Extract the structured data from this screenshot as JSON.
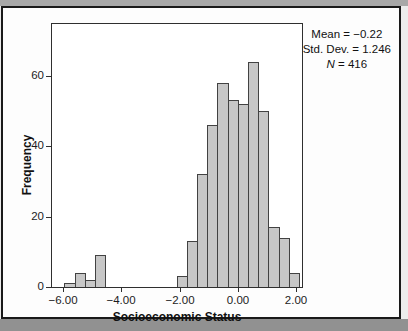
{
  "figure": {
    "stats_box": {
      "line1": "Mean = −0.22",
      "line2": "Std. Dev. = 1.246",
      "line3_italic": "N",
      "line3_rest": " = 416"
    }
  },
  "chart_data": {
    "type": "bar",
    "subtype": "histogram",
    "title": "",
    "xlabel": "Socioeconomic Status",
    "ylabel": "Frequency",
    "legend": "none",
    "grid": false,
    "xlim": [
      -6.41,
      2.25
    ],
    "ylim": [
      0,
      75
    ],
    "x_ticks": [
      {
        "value": -6,
        "label": "−6.00"
      },
      {
        "value": -4,
        "label": "−4.00"
      },
      {
        "value": -2,
        "label": "−2.00"
      },
      {
        "value": 0,
        "label": "0.00"
      },
      {
        "value": 2,
        "label": "2.00"
      }
    ],
    "y_ticks": [
      {
        "value": 0,
        "label": "0"
      },
      {
        "value": 20,
        "label": "20"
      },
      {
        "value": 40,
        "label": "40"
      },
      {
        "value": 60,
        "label": "60"
      }
    ],
    "bin_width": 0.35,
    "bars": [
      {
        "x_start": -5.95,
        "count": 1
      },
      {
        "x_start": -5.6,
        "count": 4
      },
      {
        "x_start": -5.25,
        "count": 2
      },
      {
        "x_start": -4.9,
        "count": 9
      },
      {
        "x_start": -2.1,
        "count": 3
      },
      {
        "x_start": -1.75,
        "count": 13
      },
      {
        "x_start": -1.4,
        "count": 32
      },
      {
        "x_start": -1.05,
        "count": 46
      },
      {
        "x_start": -0.7,
        "count": 58
      },
      {
        "x_start": -0.35,
        "count": 53
      },
      {
        "x_start": 0.0,
        "count": 52
      },
      {
        "x_start": 0.35,
        "count": 64
      },
      {
        "x_start": 0.7,
        "count": 50
      },
      {
        "x_start": 1.05,
        "count": 17
      },
      {
        "x_start": 1.4,
        "count": 14
      },
      {
        "x_start": 1.75,
        "count": 4
      }
    ],
    "stats": {
      "mean": -0.22,
      "std_dev": 1.246,
      "n": 416
    },
    "colors": {
      "bar_fill": "#c7c7c7",
      "bar_border": "#424242",
      "frame_border": "#2f2f2f",
      "text": "#1a1a1a",
      "scan_band_top": "#a8a8a8",
      "scan_band_bottom": "#919191",
      "page_background": "#fdfdfd"
    }
  }
}
